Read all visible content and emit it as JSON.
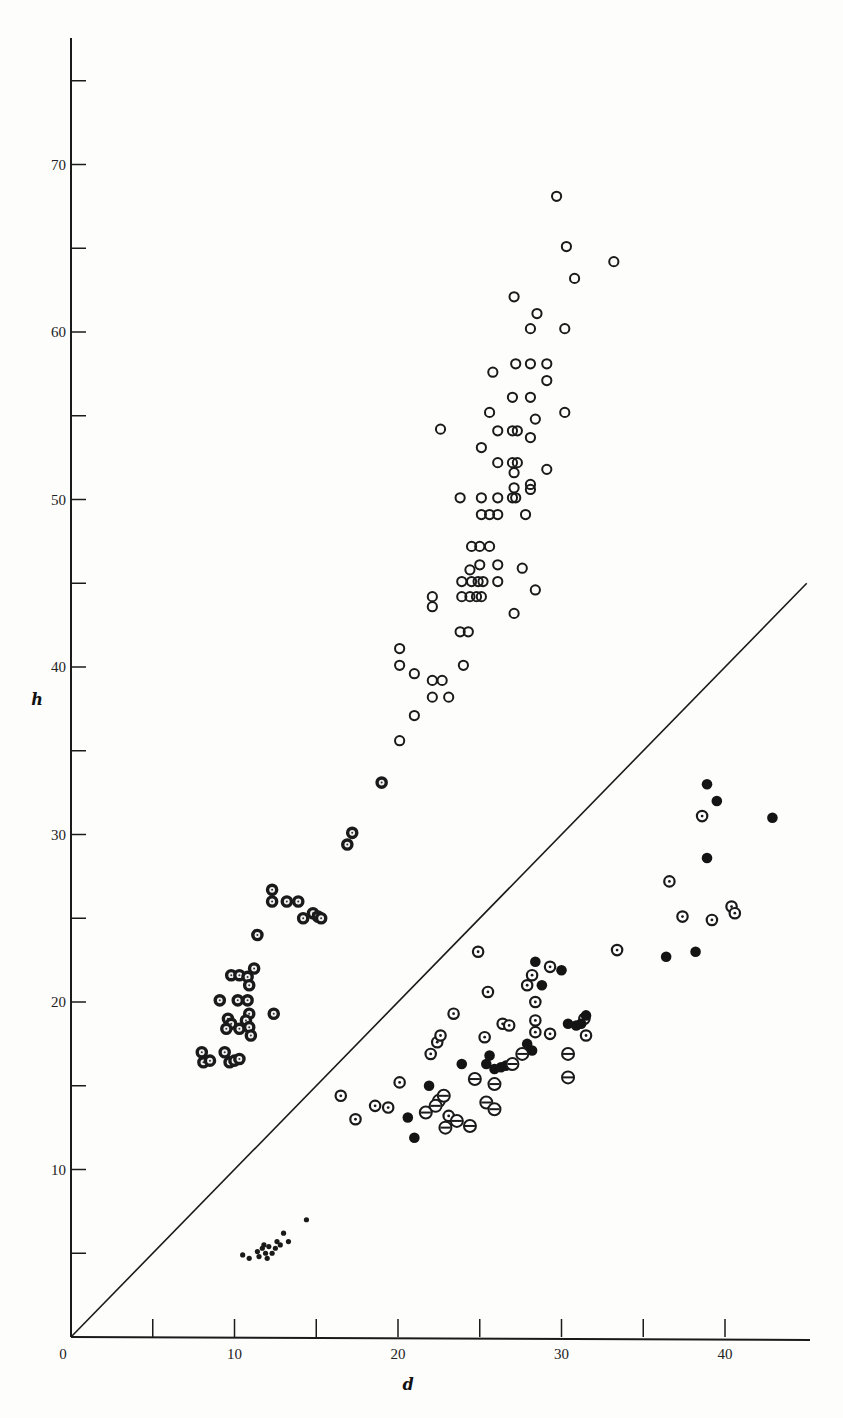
{
  "chart_data": {
    "type": "scatter",
    "title": "",
    "xlabel": "d",
    "ylabel": "h",
    "xlim": [
      0,
      45
    ],
    "ylim": [
      0,
      78
    ],
    "x_ticks": [
      0,
      5,
      10,
      15,
      20,
      25,
      30,
      35,
      40
    ],
    "x_tick_labels": [
      "0",
      "",
      "10",
      "",
      "20",
      "",
      "30",
      "",
      "40"
    ],
    "y_ticks": [
      5,
      10,
      15,
      20,
      25,
      30,
      35,
      40,
      45,
      50,
      55,
      60,
      65,
      70,
      75
    ],
    "y_tick_labels": [
      "",
      "10",
      "",
      "20",
      "",
      "30",
      "",
      "40",
      "",
      "50",
      "",
      "60",
      "",
      "70",
      ""
    ],
    "grid": false,
    "legend": null,
    "reference_line": {
      "label": "h = d",
      "x": [
        0,
        45
      ],
      "y": [
        0,
        45
      ]
    },
    "series": [
      {
        "name": "open circles",
        "marker": "open-circle",
        "points": [
          [
            29.7,
            68.1
          ],
          [
            30.3,
            65.1
          ],
          [
            30.8,
            63.2
          ],
          [
            33.2,
            64.2
          ],
          [
            27.1,
            62.1
          ],
          [
            28.5,
            61.1
          ],
          [
            28.1,
            60.2
          ],
          [
            30.2,
            60.2
          ],
          [
            27.2,
            58.1
          ],
          [
            28.1,
            58.1
          ],
          [
            29.1,
            58.1
          ],
          [
            25.8,
            57.6
          ],
          [
            29.1,
            57.1
          ],
          [
            27.0,
            56.1
          ],
          [
            28.1,
            56.1
          ],
          [
            25.6,
            55.2
          ],
          [
            28.4,
            54.8
          ],
          [
            30.2,
            55.2
          ],
          [
            22.6,
            54.2
          ],
          [
            26.1,
            54.1
          ],
          [
            27.0,
            54.1
          ],
          [
            27.3,
            54.1
          ],
          [
            28.1,
            53.7
          ],
          [
            25.1,
            53.1
          ],
          [
            26.1,
            52.2
          ],
          [
            27.0,
            52.2
          ],
          [
            27.3,
            52.2
          ],
          [
            29.1,
            51.8
          ],
          [
            27.1,
            51.6
          ],
          [
            28.1,
            50.9
          ],
          [
            27.1,
            50.7
          ],
          [
            28.1,
            50.6
          ],
          [
            23.8,
            50.1
          ],
          [
            25.1,
            50.1
          ],
          [
            26.1,
            50.1
          ],
          [
            27.0,
            50.1
          ],
          [
            27.2,
            50.1
          ],
          [
            25.1,
            49.1
          ],
          [
            25.6,
            49.1
          ],
          [
            26.1,
            49.1
          ],
          [
            27.8,
            49.1
          ],
          [
            24.5,
            47.2
          ],
          [
            25.0,
            47.2
          ],
          [
            25.6,
            47.2
          ],
          [
            25.0,
            46.1
          ],
          [
            24.4,
            45.8
          ],
          [
            26.1,
            46.1
          ],
          [
            27.6,
            45.9
          ],
          [
            23.9,
            45.1
          ],
          [
            24.5,
            45.1
          ],
          [
            24.9,
            45.1
          ],
          [
            25.2,
            45.1
          ],
          [
            26.1,
            45.1
          ],
          [
            28.4,
            44.6
          ],
          [
            22.1,
            44.2
          ],
          [
            23.9,
            44.2
          ],
          [
            24.4,
            44.2
          ],
          [
            24.8,
            44.2
          ],
          [
            25.1,
            44.2
          ],
          [
            22.1,
            43.6
          ],
          [
            27.1,
            43.2
          ],
          [
            23.8,
            42.1
          ],
          [
            24.3,
            42.1
          ],
          [
            20.1,
            41.1
          ],
          [
            24.0,
            40.1
          ],
          [
            20.1,
            40.1
          ],
          [
            21.0,
            39.6
          ],
          [
            22.1,
            39.2
          ],
          [
            22.7,
            39.2
          ],
          [
            22.1,
            38.2
          ],
          [
            23.1,
            38.2
          ],
          [
            21.0,
            37.1
          ],
          [
            20.1,
            35.6
          ]
        ]
      },
      {
        "name": "heavy-ring dotted circles",
        "marker": "heavy-ring-dot",
        "points": [
          [
            19.0,
            33.1
          ],
          [
            17.2,
            30.1
          ],
          [
            16.9,
            29.4
          ],
          [
            12.3,
            26.7
          ],
          [
            12.3,
            26.0
          ],
          [
            13.2,
            26.0
          ],
          [
            13.9,
            26.0
          ],
          [
            14.2,
            25.0
          ],
          [
            14.8,
            25.3
          ],
          [
            15.1,
            25.1
          ],
          [
            15.3,
            25.0
          ],
          [
            11.4,
            24.0
          ],
          [
            11.2,
            22.0
          ],
          [
            9.8,
            21.6
          ],
          [
            10.3,
            21.6
          ],
          [
            10.8,
            21.5
          ],
          [
            10.9,
            21.0
          ],
          [
            9.1,
            20.1
          ],
          [
            10.2,
            20.1
          ],
          [
            10.8,
            20.1
          ],
          [
            12.4,
            19.3
          ],
          [
            10.9,
            19.3
          ],
          [
            9.6,
            19.0
          ],
          [
            9.8,
            18.7
          ],
          [
            10.7,
            18.9
          ],
          [
            10.3,
            18.4
          ],
          [
            9.5,
            18.4
          ],
          [
            10.9,
            18.5
          ],
          [
            11.0,
            18.0
          ],
          [
            8.0,
            17.0
          ],
          [
            8.1,
            16.4
          ],
          [
            8.5,
            16.5
          ],
          [
            9.4,
            17.0
          ],
          [
            9.7,
            16.4
          ],
          [
            10.0,
            16.5
          ],
          [
            10.3,
            16.6
          ]
        ]
      },
      {
        "name": "dotted circles",
        "marker": "dot-circle",
        "points": [
          [
            16.5,
            14.4
          ],
          [
            17.4,
            13.0
          ],
          [
            18.6,
            13.8
          ],
          [
            19.4,
            13.7
          ],
          [
            20.1,
            15.2
          ],
          [
            22.0,
            16.9
          ],
          [
            22.4,
            17.6
          ],
          [
            22.6,
            18.0
          ],
          [
            23.4,
            19.3
          ],
          [
            24.9,
            23.0
          ],
          [
            25.3,
            17.9
          ],
          [
            25.5,
            20.6
          ],
          [
            26.4,
            18.7
          ],
          [
            26.8,
            18.6
          ],
          [
            27.9,
            21.0
          ],
          [
            28.2,
            21.6
          ],
          [
            28.4,
            20.0
          ],
          [
            28.4,
            18.9
          ],
          [
            28.4,
            18.2
          ],
          [
            29.3,
            22.1
          ],
          [
            29.3,
            18.1
          ],
          [
            31.4,
            19.0
          ],
          [
            31.5,
            18.0
          ],
          [
            33.4,
            23.1
          ],
          [
            23.1,
            13.2
          ],
          [
            36.6,
            27.2
          ],
          [
            37.4,
            25.1
          ],
          [
            38.6,
            31.1
          ],
          [
            39.2,
            24.9
          ],
          [
            40.4,
            25.7
          ],
          [
            40.6,
            25.3
          ]
        ]
      },
      {
        "name": "filled circles",
        "marker": "filled-circle",
        "points": [
          [
            20.6,
            13.1
          ],
          [
            21.0,
            11.9
          ],
          [
            21.9,
            15.0
          ],
          [
            23.9,
            16.3
          ],
          [
            25.4,
            16.3
          ],
          [
            25.6,
            16.8
          ],
          [
            25.9,
            16.0
          ],
          [
            26.3,
            16.1
          ],
          [
            26.6,
            16.2
          ],
          [
            27.9,
            17.5
          ],
          [
            28.2,
            17.1
          ],
          [
            28.4,
            22.4
          ],
          [
            28.8,
            21.0
          ],
          [
            30.0,
            21.9
          ],
          [
            30.4,
            18.7
          ],
          [
            30.9,
            18.6
          ],
          [
            31.2,
            18.7
          ],
          [
            31.5,
            19.2
          ],
          [
            36.4,
            22.7
          ],
          [
            38.2,
            23.0
          ],
          [
            38.9,
            28.6
          ],
          [
            38.9,
            33.0
          ],
          [
            39.5,
            32.0
          ],
          [
            42.9,
            31.0
          ]
        ]
      },
      {
        "name": "barred circles",
        "marker": "bar-circle",
        "points": [
          [
            21.7,
            13.4
          ],
          [
            22.5,
            14.1
          ],
          [
            22.3,
            13.8
          ],
          [
            22.8,
            14.4
          ],
          [
            23.6,
            12.9
          ],
          [
            22.9,
            12.5
          ],
          [
            24.4,
            12.6
          ],
          [
            24.7,
            15.4
          ],
          [
            25.4,
            14.0
          ],
          [
            25.9,
            13.6
          ],
          [
            25.9,
            15.1
          ],
          [
            27.0,
            16.3
          ],
          [
            27.6,
            16.9
          ],
          [
            30.4,
            16.9
          ],
          [
            30.4,
            15.5
          ]
        ]
      },
      {
        "name": "small dots",
        "marker": "small-dot",
        "points": [
          [
            10.5,
            4.9
          ],
          [
            10.9,
            4.7
          ],
          [
            11.5,
            4.8
          ],
          [
            11.4,
            5.1
          ],
          [
            11.7,
            5.3
          ],
          [
            11.9,
            5.0
          ],
          [
            12.0,
            4.7
          ],
          [
            12.1,
            5.4
          ],
          [
            12.3,
            5.0
          ],
          [
            12.5,
            5.3
          ],
          [
            12.6,
            5.7
          ],
          [
            12.8,
            5.5
          ],
          [
            13.0,
            6.2
          ],
          [
            13.3,
            5.7
          ],
          [
            11.8,
            5.5
          ],
          [
            14.4,
            7.0
          ]
        ]
      }
    ]
  }
}
